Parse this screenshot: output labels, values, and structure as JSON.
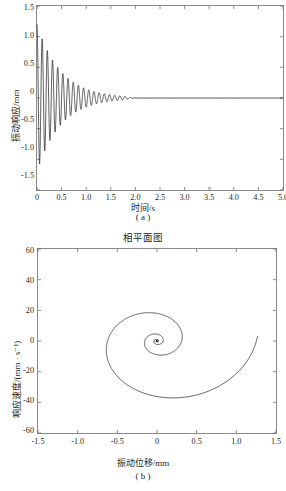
{
  "figure": {
    "background": "#ffffff",
    "line_color": "#1a1718",
    "axis_color": "#6d6e70"
  },
  "panel_a": {
    "caption": "( a )",
    "xlabel": "时间/s",
    "ylabel": "振动响应/mm",
    "xticks": [
      "0",
      "0.5",
      "1.0",
      "1.5",
      "2.0",
      "2.5",
      "3.0",
      "3.5",
      "4.0",
      "4.5",
      "5.0"
    ],
    "yticks": [
      "1.5",
      "1.0",
      "0.5",
      "0",
      "-0.5",
      "-1.0",
      "-1.5"
    ]
  },
  "panel_b": {
    "title": "相平面图",
    "caption": "( b )",
    "xlabel": "振动位移/mm",
    "ylabel": "响应速度/(mm · s⁻¹)",
    "xticks": [
      "-1.5",
      "-1.0",
      "-0.5",
      "0",
      "0.5",
      "1.0",
      "1.5"
    ],
    "yticks": [
      "60",
      "40",
      "20",
      "0",
      "-20",
      "-40",
      "-60"
    ]
  },
  "chart_data": [
    {
      "type": "line",
      "panel": "a",
      "title": "",
      "xlabel": "时间/s",
      "ylabel": "振动响应/mm",
      "xlim": [
        0,
        5.0
      ],
      "ylim": [
        -1.5,
        1.5
      ],
      "xticks": [
        0,
        0.5,
        1.0,
        1.5,
        2.0,
        2.5,
        3.0,
        3.5,
        4.0,
        4.5,
        5.0
      ],
      "yticks": [
        -1.5,
        -1.0,
        -0.5,
        0,
        0.5,
        1.0,
        1.5
      ],
      "grid": false,
      "legend": null,
      "series": [
        {
          "name": "振动响应",
          "description": "指数衰减正弦振动：x(t)=A·e^(-ζωt)·sin(ωd·t+φ)",
          "initial_amplitude": 1.2,
          "damping_ratio": 0.035,
          "frequency_hz": 9.5,
          "settling_time_s": 2.0,
          "peaks": [
            {
              "t": 0.0,
              "x": 1.2
            },
            {
              "t": 0.055,
              "x": -1.03
            },
            {
              "t": 0.16,
              "x": 0.85
            },
            {
              "t": 0.26,
              "x": -0.7
            },
            {
              "t": 0.37,
              "x": 0.6
            },
            {
              "t": 0.47,
              "x": -0.49
            },
            {
              "t": 0.58,
              "x": 0.42
            },
            {
              "t": 0.68,
              "x": -0.35
            },
            {
              "t": 0.79,
              "x": 0.3
            },
            {
              "t": 0.89,
              "x": -0.25
            },
            {
              "t": 1.0,
              "x": 0.2
            },
            {
              "t": 1.1,
              "x": -0.17
            },
            {
              "t": 1.21,
              "x": 0.14
            },
            {
              "t": 1.31,
              "x": -0.12
            },
            {
              "t": 1.42,
              "x": 0.1
            },
            {
              "t": 1.52,
              "x": -0.08
            },
            {
              "t": 1.63,
              "x": 0.06
            },
            {
              "t": 1.73,
              "x": -0.05
            },
            {
              "t": 1.84,
              "x": 0.04
            },
            {
              "t": 2.0,
              "x": 0.0
            },
            {
              "t": 5.0,
              "x": 0.0
            }
          ]
        }
      ]
    },
    {
      "type": "line",
      "panel": "b",
      "title": "相平面图",
      "xlabel": "振动位移/mm",
      "ylabel": "响应速度/(mm · s⁻¹)",
      "xlim": [
        -1.5,
        1.5
      ],
      "ylim": [
        -60,
        60
      ],
      "xticks": [
        -1.5,
        -1.0,
        -0.5,
        0,
        0.5,
        1.0,
        1.5
      ],
      "yticks": [
        -60,
        -40,
        -20,
        0,
        20,
        40,
        60
      ],
      "grid": false,
      "legend": null,
      "series": [
        {
          "name": "相轨迹",
          "description": "阻尼振动的相平面轨迹，由外向内收敛到原点的螺旋线",
          "start_point": {
            "x": 1.25,
            "v": 3
          },
          "end_point": {
            "x": 0,
            "v": 0
          },
          "turns": 9,
          "extrema": [
            {
              "x": 1.25,
              "v": 3
            },
            {
              "x": 0.05,
              "v": -50
            },
            {
              "x": -1.03,
              "v": 0
            },
            {
              "x": 0.0,
              "v": 42
            },
            {
              "x": 0.86,
              "v": 0
            },
            {
              "x": 0.1,
              "v": -34
            },
            {
              "x": -0.7,
              "v": 0
            },
            {
              "x": -0.02,
              "v": 29
            },
            {
              "x": 0.58,
              "v": 0
            },
            {
              "x": 0.08,
              "v": -23
            },
            {
              "x": -0.48,
              "v": 0
            },
            {
              "x": -0.02,
              "v": 19
            },
            {
              "x": 0.39,
              "v": 0
            },
            {
              "x": 0.05,
              "v": -15
            },
            {
              "x": -0.32,
              "v": 0
            },
            {
              "x": 0.0,
              "v": 13
            },
            {
              "x": 0.25,
              "v": 0
            },
            {
              "x": 0.04,
              "v": -9
            },
            {
              "x": -0.2,
              "v": 0
            },
            {
              "x": 0.0,
              "v": 8
            },
            {
              "x": 0.13,
              "v": 0
            },
            {
              "x": 0.0,
              "v": -5
            },
            {
              "x": -0.08,
              "v": 0
            },
            {
              "x": 0.0,
              "v": 4
            },
            {
              "x": 0.0,
              "v": 0
            }
          ]
        }
      ]
    }
  ]
}
